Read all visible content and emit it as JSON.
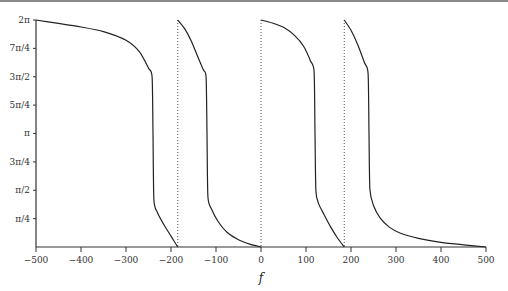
{
  "chart_data": {
    "type": "line",
    "title": "",
    "xlabel": "f",
    "ylabel": "",
    "xlim": [
      -500,
      500
    ],
    "ylim": [
      0,
      6.283185307
    ],
    "grid": false,
    "legend": null,
    "x_ticks": [
      -500,
      -400,
      -300,
      -200,
      -100,
      0,
      100,
      200,
      300,
      400,
      500
    ],
    "x_tick_labels": [
      "−500",
      "−400",
      "−300",
      "−200",
      "−100",
      "0",
      "100",
      "200",
      "300",
      "400",
      "500"
    ],
    "y_ticks": [
      0.785398,
      1.570796,
      2.356194,
      3.141593,
      3.926991,
      4.712389,
      5.497787,
      6.283185
    ],
    "y_tick_labels": [
      "π/4",
      "π/2",
      "3π/4",
      "π",
      "5π/4",
      "3π/2",
      "7π/4",
      "2π"
    ],
    "vertical_dotted_lines": [
      -185,
      0,
      185
    ],
    "series": [
      {
        "name": "branch-1",
        "x": [
          -500,
          -450,
          -400,
          -350,
          -300,
          -270,
          -250,
          -242,
          -240,
          -238,
          -230,
          -215,
          -200,
          -185
        ],
        "y": [
          6.283,
          6.19,
          6.09,
          5.96,
          5.72,
          5.4,
          4.95,
          4.71,
          3.14,
          1.3,
          0.95,
          0.6,
          0.3,
          0.0
        ]
      },
      {
        "name": "branch-2",
        "x": [
          -185,
          -170,
          -155,
          -140,
          -128,
          -122,
          -120,
          -118,
          -110,
          -95,
          -75,
          -50,
          -25,
          0
        ],
        "y": [
          6.283,
          6.05,
          5.7,
          5.25,
          4.9,
          4.7,
          3.14,
          1.4,
          1.05,
          0.7,
          0.4,
          0.2,
          0.08,
          0.0
        ]
      },
      {
        "name": "branch-3",
        "x": [
          0,
          25,
          50,
          75,
          95,
          110,
          118,
          120,
          122,
          128,
          140,
          155,
          170,
          185
        ],
        "y": [
          6.283,
          6.2,
          6.08,
          5.85,
          5.55,
          5.15,
          4.85,
          3.14,
          1.55,
          1.2,
          0.9,
          0.55,
          0.25,
          0.0
        ]
      },
      {
        "name": "branch-4",
        "x": [
          185,
          200,
          215,
          230,
          238,
          240,
          242,
          250,
          265,
          285,
          310,
          350,
          400,
          450,
          500
        ],
        "y": [
          6.283,
          6.0,
          5.6,
          5.1,
          4.8,
          3.14,
          1.6,
          1.15,
          0.8,
          0.55,
          0.38,
          0.24,
          0.13,
          0.06,
          0.0
        ]
      }
    ]
  }
}
